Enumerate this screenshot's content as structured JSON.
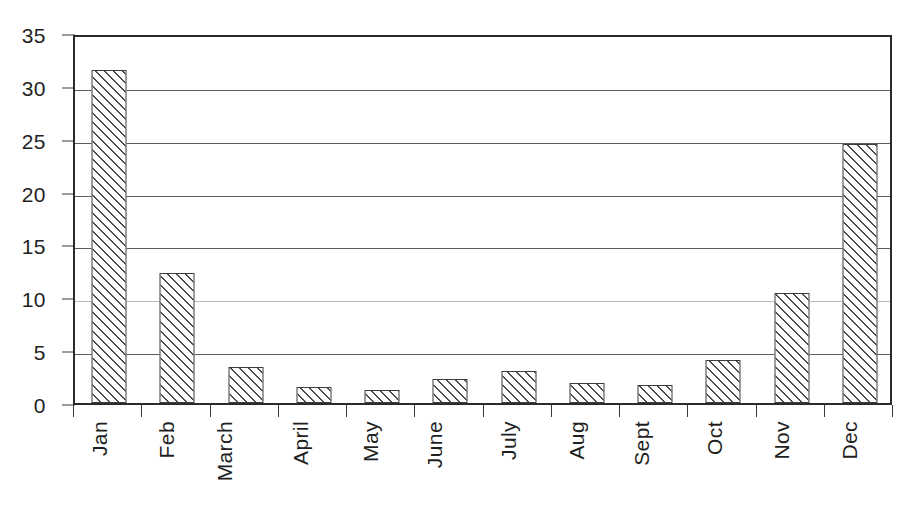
{
  "chart_data": {
    "type": "bar",
    "title": "",
    "subtitle": "",
    "xlabel": "",
    "ylabel": "",
    "categories": [
      "Jan",
      "Feb",
      "March",
      "April",
      "May",
      "June",
      "July",
      "Aug",
      "Sept",
      "Oct",
      "Nov",
      "Dec"
    ],
    "values": [
      31.5,
      12.3,
      3.4,
      1.5,
      1.2,
      2.3,
      3.0,
      1.9,
      1.7,
      4.1,
      10.4,
      24.5
    ],
    "series": [
      {
        "name": "",
        "values": [
          31.5,
          12.3,
          3.4,
          1.5,
          1.2,
          2.3,
          3.0,
          1.9,
          1.7,
          4.1,
          10.4,
          24.5
        ]
      }
    ],
    "ylim": [
      0,
      35
    ],
    "yticks": [
      0,
      5,
      10,
      15,
      20,
      25,
      30,
      35
    ],
    "ytick_labels": [
      "0",
      "5",
      "10",
      "15",
      "20",
      "25",
      "30",
      "35"
    ],
    "grid": true,
    "grid_axis": "y",
    "legend": false,
    "legend_position": "none",
    "bar_fill": "diagonal-hatch",
    "annotations": []
  },
  "style": {
    "background": "#ffffff",
    "axis_color": "#2b2b2b",
    "grid_color": "#5d5d5d",
    "bar_edge_color": "#3c3c3c",
    "hatch_color": "#4a4a4a",
    "text_color": "#1f1f1f"
  }
}
